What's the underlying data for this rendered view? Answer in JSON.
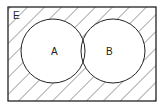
{
  "diagram": {
    "type": "venn",
    "universe_label": "E",
    "sets": [
      {
        "label": "A"
      },
      {
        "label": "B"
      }
    ],
    "shaded_region": "complement of A union B",
    "colors": {
      "stroke": "#222222",
      "hatch": "#555555",
      "background": "#ffffff"
    }
  }
}
